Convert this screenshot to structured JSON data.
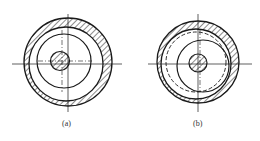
{
  "figure": {
    "panels": [
      {
        "id": "a",
        "caption": "(a)"
      },
      {
        "id": "b",
        "caption": "(b)"
      }
    ],
    "colors": {
      "stroke": "#1a1a1a",
      "background": "#ffffff"
    }
  }
}
